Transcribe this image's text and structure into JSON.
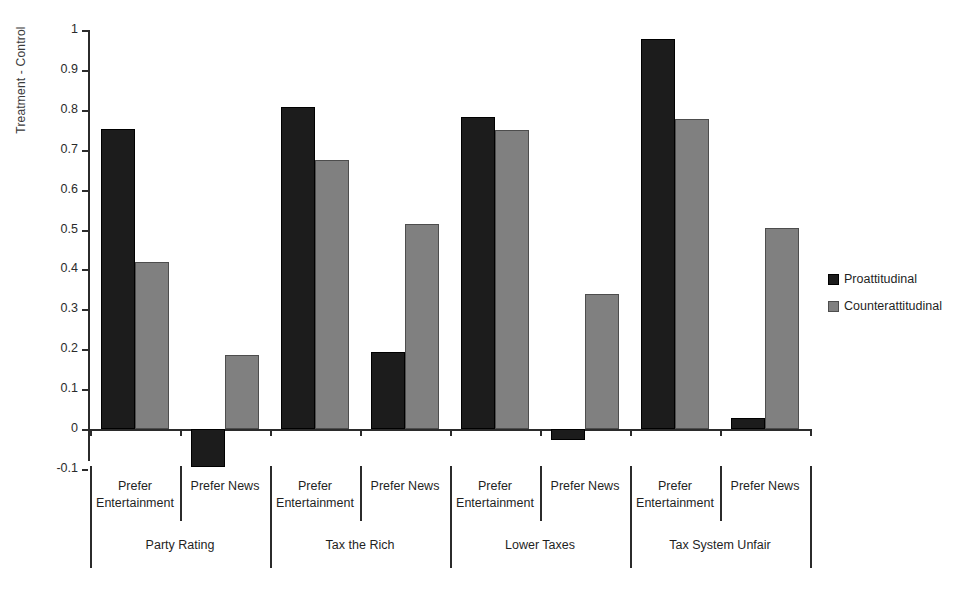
{
  "chart_data": {
    "type": "bar",
    "title": "",
    "xlabel": "",
    "ylabel": "Treatment - Control",
    "ylim": [
      -0.1,
      1
    ],
    "ytick_labels": [
      "1",
      "0.9",
      "0.8",
      "0.7",
      "0.6",
      "0.5",
      "0.4",
      "0.3",
      "0.2",
      "0.1",
      "0",
      "-0.1"
    ],
    "ytick_values": [
      1,
      0.9,
      0.8,
      0.7,
      0.6,
      0.5,
      0.4,
      0.3,
      0.2,
      0.1,
      0,
      -0.1
    ],
    "grid": false,
    "legend_position": "right",
    "groups": [
      "Party Rating",
      "Tax the Rich",
      "Lower Taxes",
      "Tax System Unfair"
    ],
    "subgroups": [
      "Prefer Entertainment",
      "Prefer News"
    ],
    "categories": [
      "Party Rating / Prefer Entertainment",
      "Party Rating / Prefer News",
      "Tax the Rich / Prefer Entertainment",
      "Tax the Rich / Prefer News",
      "Lower Taxes / Prefer Entertainment",
      "Lower Taxes / Prefer News",
      "Tax System Unfair / Prefer Entertainment",
      "Tax System Unfair / Prefer News"
    ],
    "series": [
      {
        "name": "Proattitudinal",
        "color": "#1c1c1c",
        "values": [
          0.752,
          -0.095,
          0.806,
          0.193,
          0.782,
          -0.028,
          0.977,
          0.028
        ]
      },
      {
        "name": "Counterattitudinal",
        "color": "#808080",
        "values": [
          0.419,
          0.186,
          0.673,
          0.514,
          0.75,
          0.338,
          0.777,
          0.505
        ]
      }
    ]
  },
  "legend": {
    "items": [
      {
        "label": "Proattitudinal",
        "swatch": "pro"
      },
      {
        "label": "Counterattitudinal",
        "swatch": "counter"
      }
    ]
  },
  "axis": {
    "y_title": "Treatment - Control"
  }
}
